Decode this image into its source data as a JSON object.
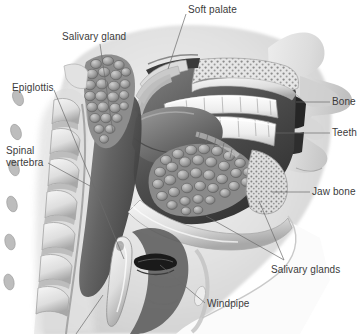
{
  "figure": {
    "background_color": "#ffffff",
    "label_color": "#3b3b3b",
    "leader_color": "#6b6b6b",
    "style": "grayscale medical illustration"
  },
  "labels": [
    {
      "id": "soft-palate",
      "text": "Soft palate",
      "x": 188,
      "y": 4,
      "align": "left"
    },
    {
      "id": "salivary-gland",
      "text": "Salivary gland",
      "x": 62,
      "y": 31,
      "align": "left"
    },
    {
      "id": "epiglottis",
      "text": "Epiglottis",
      "x": 12,
      "y": 82,
      "align": "left"
    },
    {
      "id": "spinal-vertebra",
      "text": "Spinal vertebra",
      "x": 6,
      "y": 145,
      "align": "left"
    },
    {
      "id": "bone",
      "text": "Bone",
      "x": 332,
      "y": 96,
      "align": "left"
    },
    {
      "id": "teeth",
      "text": "Teeth",
      "x": 332,
      "y": 127,
      "align": "left"
    },
    {
      "id": "jaw-bone",
      "text": "Jaw bone",
      "x": 312,
      "y": 186,
      "align": "left"
    },
    {
      "id": "salivary-glands",
      "text": "Salivary glands",
      "x": 271,
      "y": 264,
      "align": "left"
    },
    {
      "id": "windpipe",
      "text": "Windpipe",
      "x": 207,
      "y": 298,
      "align": "left"
    }
  ],
  "leaders": [
    {
      "id": "leader-soft-palate",
      "from": [
        186,
        14
      ],
      "to": [
        168,
        69
      ]
    },
    {
      "id": "leader-salivary-gland",
      "from": [
        100,
        44
      ],
      "to": [
        113,
        133
      ]
    },
    {
      "id": "leader-epiglottis",
      "from": [
        54,
        90
      ],
      "to": [
        124,
        259
      ]
    },
    {
      "id": "leader-spinal-vertebra",
      "from": [
        48,
        163
      ],
      "to": [
        90,
        186
      ]
    },
    {
      "id": "leader-bone",
      "from": [
        330,
        102
      ],
      "to": [
        296,
        102
      ]
    },
    {
      "id": "leader-teeth",
      "from": [
        330,
        133
      ],
      "to": [
        276,
        133
      ]
    },
    {
      "id": "leader-jaw-bone",
      "from": [
        310,
        192
      ],
      "to": [
        272,
        192
      ]
    },
    {
      "id": "leader-salivary-a",
      "from": [
        284,
        260
      ],
      "to": [
        206,
        216
      ]
    },
    {
      "id": "leader-salivary-b",
      "from": [
        284,
        260
      ],
      "to": [
        259,
        201
      ]
    },
    {
      "id": "leader-windpipe",
      "from": [
        205,
        303
      ],
      "to": [
        160,
        265
      ]
    },
    {
      "id": "leader-bottom-cut",
      "from": [
        103,
        295
      ],
      "to": [
        76,
        334
      ]
    }
  ],
  "structures": [
    {
      "id": "parotid-gland",
      "name": "Salivary gland (parotid)"
    },
    {
      "id": "submandibular-gland",
      "name": "Salivary glands (submandibular / sublingual)"
    },
    {
      "id": "hard-palate-bone",
      "name": "Bone (hard palate / maxilla)"
    },
    {
      "id": "upper-teeth",
      "name": "Upper teeth"
    },
    {
      "id": "lower-teeth",
      "name": "Lower teeth"
    },
    {
      "id": "mandible",
      "name": "Jaw bone (mandible)"
    },
    {
      "id": "tongue",
      "name": "Tongue"
    },
    {
      "id": "soft-palate-body",
      "name": "Soft palate"
    },
    {
      "id": "epiglottis-body",
      "name": "Epiglottis"
    },
    {
      "id": "vertebrae",
      "name": "Spinal vertebrae"
    },
    {
      "id": "trachea",
      "name": "Windpipe (trachea)"
    },
    {
      "id": "nose-profile",
      "name": "Nose and face profile"
    }
  ]
}
